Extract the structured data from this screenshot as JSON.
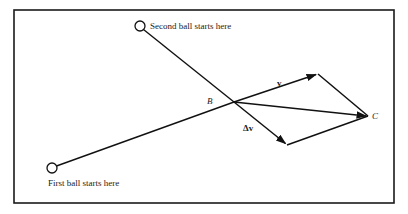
{
  "diagram": {
    "colors": {
      "line": "#111111",
      "text": "#222222",
      "frame": "#1a1a1a",
      "background": "#ffffff"
    },
    "labels": {
      "second_ball": "Second ball starts here",
      "first_ball": "First ball starts here",
      "point_b": "B",
      "point_c": "C",
      "velocity": "v",
      "delta_velocity": "Δv"
    },
    "elements": {
      "second_ball_start": {
        "x": 140,
        "y": 26
      },
      "first_ball_start": {
        "x": 52,
        "y": 168
      },
      "intersection_b": {
        "x": 234,
        "y": 102
      },
      "v_tip": {
        "x": 318,
        "y": 74
      },
      "delta_v_tip": {
        "x": 287,
        "y": 145
      },
      "point_c": {
        "x": 368,
        "y": 116
      }
    }
  }
}
